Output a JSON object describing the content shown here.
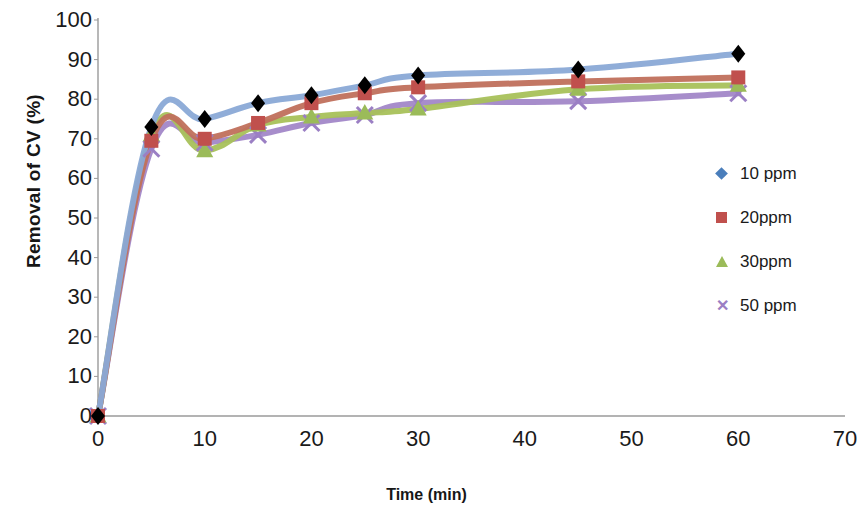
{
  "chart_data": {
    "type": "line",
    "title": "",
    "xlabel": "Time (min)",
    "ylabel": "Removal of CV (%)",
    "xlim": [
      0,
      70
    ],
    "ylim": [
      0,
      100
    ],
    "xticks": [
      0,
      10,
      20,
      30,
      40,
      50,
      60,
      70
    ],
    "yticks": [
      0,
      10,
      20,
      30,
      40,
      50,
      60,
      70,
      80,
      90,
      100
    ],
    "grid": false,
    "legend_position": "right",
    "x": [
      0,
      5,
      10,
      15,
      20,
      25,
      30,
      45,
      60
    ],
    "series": [
      {
        "name": "10 ppm",
        "color": "#8aa9d6",
        "marker": "diamond",
        "marker_color": "#000000",
        "values": [
          0,
          73,
          75,
          79,
          81,
          83.5,
          86,
          87.5,
          91.5
        ]
      },
      {
        "name": "20ppm",
        "color": "#c0705c",
        "marker": "square",
        "marker_color": "#c0504d",
        "values": [
          0,
          69.5,
          70,
          74,
          79,
          81.5,
          83,
          84.5,
          85.5
        ]
      },
      {
        "name": "30ppm",
        "color": "#a8c15a",
        "marker": "triangle",
        "marker_color": "#9bbb59",
        "values": [
          0,
          71,
          67,
          73.5,
          75.5,
          76.5,
          77.5,
          82.5,
          83.5
        ]
      },
      {
        "name": "50 ppm",
        "color": "#a287c8",
        "marker": "x",
        "marker_color": "#9b7fc4",
        "values": [
          0,
          67.5,
          69,
          71,
          74,
          76,
          79,
          79.5,
          81.5
        ]
      }
    ],
    "legend_entries": [
      "10 ppm",
      "20ppm",
      "30ppm",
      "50 ppm"
    ]
  },
  "axis": {
    "y_title": "Removal of CV (%)",
    "x_title": "Time (min)",
    "y_tick_labels": [
      "100",
      "90",
      "80",
      "70",
      "60",
      "50",
      "40",
      "30",
      "20",
      "10",
      "0"
    ],
    "x_tick_labels": [
      "0",
      "10",
      "20",
      "30",
      "40",
      "50",
      "60",
      "70"
    ]
  }
}
